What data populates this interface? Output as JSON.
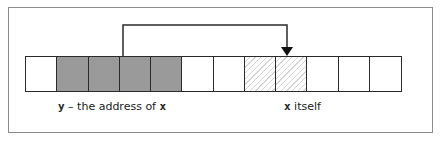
{
  "diagram": {
    "cells": [
      {
        "style": "empty"
      },
      {
        "style": "shaded"
      },
      {
        "style": "shaded"
      },
      {
        "style": "shaded"
      },
      {
        "style": "shaded"
      },
      {
        "style": "empty"
      },
      {
        "style": "empty"
      },
      {
        "style": "hatched"
      },
      {
        "style": "hatched"
      },
      {
        "style": "empty"
      },
      {
        "style": "empty"
      },
      {
        "style": "empty"
      }
    ],
    "labels": {
      "pointer": {
        "var": "y",
        "text": " – the address of ",
        "var2": "x"
      },
      "target": {
        "var": "x",
        "text": " itself"
      }
    },
    "colors": {
      "shaded": "#9a9a9a",
      "hatch": "#d6d6d6",
      "line": "#2a2a2a",
      "frame": "#8a8a8a"
    }
  }
}
